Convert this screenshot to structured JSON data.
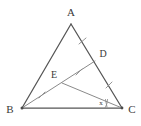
{
  "figure": {
    "type": "geometry-diagram",
    "shape": "triangle",
    "background_color": "#ffffff",
    "side_color": "#555555",
    "cevian_color": "#8a8a8a",
    "label_color": "#3a3a3a",
    "labels": {
      "A": "A",
      "B": "B",
      "C": "C",
      "D": "D",
      "E": "E",
      "angle_x": "x"
    },
    "points": {
      "A": {
        "x": 71,
        "y": 24,
        "label": "A",
        "label_x": 71,
        "label_y": 16
      },
      "B": {
        "x": 22,
        "y": 108,
        "label": "B",
        "label_x": 10,
        "label_y": 113
      },
      "C": {
        "x": 122,
        "y": 108,
        "label": "C",
        "label_x": 132,
        "label_y": 113
      },
      "D": {
        "x": 95,
        "y": 61,
        "label": "D",
        "label_x": 103,
        "label_y": 57
      },
      "E": {
        "x": 62,
        "y": 83,
        "label": "E",
        "label_x": 54,
        "label_y": 78
      }
    },
    "segments": [
      {
        "name": "AB",
        "from": "A",
        "to": "B",
        "style": "side"
      },
      {
        "name": "AC",
        "from": "A",
        "to": "C",
        "style": "side"
      },
      {
        "name": "BC",
        "from": "B",
        "to": "C",
        "style": "side"
      },
      {
        "name": "BD",
        "from": "B",
        "to": "D",
        "style": "cevian"
      },
      {
        "name": "EC",
        "from": "E",
        "to": "C",
        "style": "cevian"
      }
    ],
    "tick_marks": [
      {
        "name": "tick-AD",
        "segment": "AD",
        "count": 1,
        "x": 82,
        "y": 41
      },
      {
        "name": "tick-DC",
        "segment": "DC",
        "count": 1,
        "x": 109,
        "y": 85
      },
      {
        "name": "tick-BE",
        "segment": "BE",
        "count": 1,
        "x": 42,
        "y": 95
      },
      {
        "name": "tick-ED",
        "segment": "ED",
        "count": 1,
        "x": 79,
        "y": 72
      }
    ],
    "angle_marks": [
      {
        "name": "angle-at-C",
        "vertex": "C",
        "label": "x",
        "label_x": 101,
        "label_y": 104,
        "arc_radius": 17
      }
    ]
  }
}
